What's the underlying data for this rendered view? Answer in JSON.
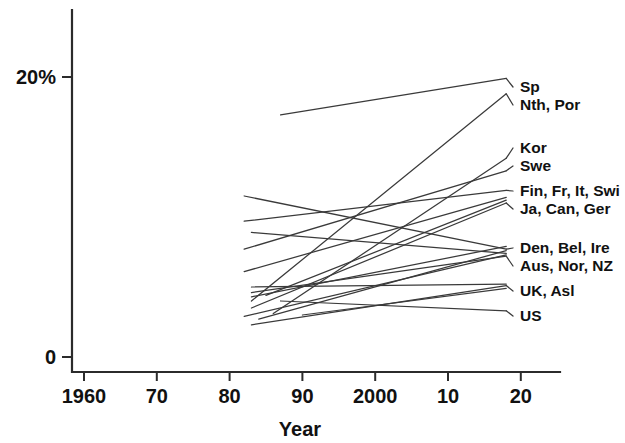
{
  "chart_data": {
    "type": "line",
    "title": "",
    "xlabel": "Year",
    "ylabel": "",
    "xlim": [
      1960,
      2020
    ],
    "ylim": [
      0,
      21
    ],
    "grid": false,
    "legend_position": "right-inline-labels",
    "x_ticks": [
      {
        "value": 1960,
        "label": "1960"
      },
      {
        "value": 1970,
        "label": "70"
      },
      {
        "value": 1980,
        "label": "80"
      },
      {
        "value": 1990,
        "label": "90"
      },
      {
        "value": 2000,
        "label": "2000"
      },
      {
        "value": 2010,
        "label": "10"
      },
      {
        "value": 2020,
        "label": "20"
      }
    ],
    "y_ticks": [
      {
        "value": 0,
        "label": "0"
      },
      {
        "value": 20,
        "label": "20%"
      }
    ],
    "series": [
      {
        "name": "Sp",
        "label": "Sp",
        "x": [
          1987,
          2018
        ],
        "values": [
          17.3,
          19.9
        ]
      },
      {
        "name": "Nth, Por",
        "label": "Nth, Por",
        "x": [
          1983,
          2018
        ],
        "values": [
          4.0,
          18.8
        ]
      },
      {
        "name": "Kor",
        "label": "Kor",
        "x": [
          1986,
          2018
        ],
        "values": [
          3.1,
          14.2
        ]
      },
      {
        "name": "Swe",
        "label": "Swe",
        "x": [
          1982,
          2018
        ],
        "values": [
          7.7,
          13.3
        ]
      },
      {
        "name": "Fin, Fr, It, Swi",
        "label": "Fin, Fr, It, Swi",
        "x": [
          1982,
          2018
        ],
        "values": [
          9.7,
          11.9
        ]
      },
      {
        "name": "Ja, Can, Ger",
        "label": "Ja, Can, Ger",
        "x": [
          1983,
          2018
        ],
        "values": [
          3.5,
          11.0
        ]
      },
      {
        "name": "Den, Bel, Ire",
        "label": "Den, Bel, Ire",
        "x": [
          1982,
          2018
        ],
        "values": [
          11.5,
          7.7
        ]
      },
      {
        "name": "Aus, Nor, NZ",
        "label": "Aus, Nor, NZ",
        "x": [
          1983,
          2018
        ],
        "values": [
          4.6,
          7.2
        ]
      },
      {
        "name": "UK, Asl",
        "label": "UK, Asl",
        "x": [
          1983,
          2018
        ],
        "values": [
          2.3,
          5.1
        ]
      },
      {
        "name": "US",
        "label": "US",
        "x": [
          1987,
          2018
        ],
        "values": [
          4.0,
          3.3
        ]
      },
      {
        "name": "extra-a",
        "label": "",
        "x": [
          1982,
          2018
        ],
        "values": [
          6.1,
          11.4
        ]
      },
      {
        "name": "extra-b",
        "label": "",
        "x": [
          1983,
          2018
        ],
        "values": [
          8.9,
          7.4
        ]
      },
      {
        "name": "extra-c",
        "label": "",
        "x": [
          1984,
          2018
        ],
        "values": [
          2.7,
          7.6
        ]
      },
      {
        "name": "extra-d",
        "label": "",
        "x": [
          1983,
          2018
        ],
        "values": [
          4.3,
          7.9
        ]
      },
      {
        "name": "extra-e",
        "label": "",
        "x": [
          1982,
          2018
        ],
        "values": [
          2.9,
          7.3
        ]
      },
      {
        "name": "extra-f",
        "label": "",
        "x": [
          1985,
          2018
        ],
        "values": [
          4.4,
          11.2
        ]
      },
      {
        "name": "extra-g",
        "label": "",
        "x": [
          1983,
          2018
        ],
        "values": [
          5.0,
          5.2
        ]
      },
      {
        "name": "extra-h",
        "label": "",
        "x": [
          1990,
          2018
        ],
        "values": [
          3.0,
          4.9
        ]
      }
    ]
  },
  "axes": {
    "x_title": "Year",
    "y_top_label": "20%",
    "y_zero_label": "0"
  },
  "series_labels": [
    {
      "text": "Sp",
      "y_px": 92
    },
    {
      "text": "Nth, Por",
      "y_px": 110
    },
    {
      "text": "Kor",
      "y_px": 153
    },
    {
      "text": "Swe",
      "y_px": 171
    },
    {
      "text": "Fin, Fr, It, Swi",
      "y_px": 196
    },
    {
      "text": "Ja, Can, Ger",
      "y_px": 214
    },
    {
      "text": "Den, Bel, Ire",
      "y_px": 253
    },
    {
      "text": "Aus, Nor, NZ",
      "y_px": 271
    },
    {
      "text": "UK, Asl",
      "y_px": 296
    },
    {
      "text": "US",
      "y_px": 321
    }
  ],
  "colors": {
    "background": "#ffffff",
    "axis": "#2b2b2b",
    "line": "#3a3a3a",
    "text": "#111111"
  }
}
